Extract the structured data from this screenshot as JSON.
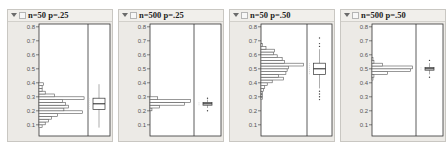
{
  "panels": [
    {
      "title": "n=50 p=.25",
      "menu_icon": "disclosure-triangle-icon",
      "option_icon": "collapse-box-icon"
    },
    {
      "title": "n=500 p=.25",
      "menu_icon": "disclosure-triangle-icon",
      "option_icon": "collapse-box-icon"
    },
    {
      "title": "n=50 p=.50",
      "menu_icon": "disclosure-triangle-icon",
      "option_icon": "collapse-box-icon"
    },
    {
      "title": "n=500 p=.50",
      "menu_icon": "disclosure-triangle-icon",
      "option_icon": "collapse-box-icon"
    }
  ],
  "chart_data": [
    {
      "type": "bar",
      "orientation": "horizontal",
      "title": "n=50 p=.25",
      "ylim": [
        0.02,
        0.82
      ],
      "yticks": [
        0.1,
        0.2,
        0.3,
        0.4,
        0.5,
        0.6,
        0.7,
        0.8
      ],
      "bins": [
        0.08,
        0.1,
        0.12,
        0.14,
        0.16,
        0.18,
        0.2,
        0.22,
        0.24,
        0.26,
        0.28,
        0.3,
        0.32,
        0.34,
        0.36,
        0.38,
        0.4
      ],
      "values": [
        2,
        4,
        6,
        8,
        12,
        28,
        16,
        19,
        17,
        15,
        29,
        10,
        4,
        2,
        2,
        3,
        0
      ],
      "boxplot": {
        "min": 0.08,
        "q1": 0.21,
        "median": 0.25,
        "q3": 0.29,
        "max": 0.39,
        "mean": 0.25
      }
    },
    {
      "type": "bar",
      "orientation": "horizontal",
      "title": "n=500 p=.25",
      "ylim": [
        0.02,
        0.82
      ],
      "yticks": [
        0.1,
        0.2,
        0.3,
        0.4,
        0.5,
        0.6,
        0.7,
        0.8
      ],
      "bins": [
        0.2,
        0.22,
        0.24,
        0.26,
        0.28
      ],
      "values": [
        2,
        10,
        36,
        42,
        8
      ],
      "boxplot": {
        "min": 0.22,
        "q1": 0.24,
        "median": 0.25,
        "q3": 0.26,
        "max": 0.28,
        "outliers": [
          0.2,
          0.29
        ],
        "mean": 0.25
      }
    },
    {
      "type": "bar",
      "orientation": "horizontal",
      "title": "n=50 p=.50",
      "ylim": [
        0.02,
        0.82
      ],
      "yticks": [
        0.1,
        0.2,
        0.3,
        0.4,
        0.5,
        0.6,
        0.7,
        0.8
      ],
      "bins": [
        0.28,
        0.3,
        0.32,
        0.34,
        0.36,
        0.38,
        0.4,
        0.42,
        0.44,
        0.46,
        0.48,
        0.5,
        0.52,
        0.54,
        0.56,
        0.58,
        0.6,
        0.62,
        0.64,
        0.66
      ],
      "values": [
        1,
        1,
        1,
        2,
        3,
        5,
        9,
        18,
        14,
        20,
        21,
        22,
        34,
        19,
        17,
        13,
        10,
        11,
        4,
        1
      ],
      "boxplot": {
        "min": 0.36,
        "q1": 0.46,
        "median": 0.5,
        "q3": 0.54,
        "max": 0.64,
        "outliers": [
          0.28,
          0.3,
          0.32,
          0.34,
          0.66,
          0.68,
          0.72
        ],
        "mean": 0.5
      }
    },
    {
      "type": "bar",
      "orientation": "horizontal",
      "title": "n=500 p=.50",
      "ylim": [
        0.02,
        0.82
      ],
      "yticks": [
        0.1,
        0.2,
        0.3,
        0.4,
        0.5,
        0.6,
        0.7,
        0.8
      ],
      "bins": [
        0.42,
        0.44,
        0.46,
        0.48,
        0.5,
        0.52,
        0.54,
        0.56
      ],
      "values": [
        1,
        2,
        16,
        40,
        42,
        11,
        2,
        1
      ],
      "boxplot": {
        "min": 0.46,
        "q1": 0.49,
        "median": 0.5,
        "q3": 0.51,
        "max": 0.54,
        "outliers": [
          0.44,
          0.56
        ],
        "mean": 0.5
      }
    }
  ]
}
